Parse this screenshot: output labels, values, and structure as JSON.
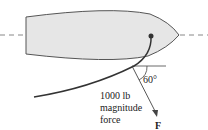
{
  "diagram": {
    "angle_label": "60°",
    "force_text": [
      "1000 lb",
      "magnitude",
      "force"
    ],
    "vector_label": "F",
    "colors": {
      "hull_fill": "#e6e6e6",
      "line": "#444444",
      "dash": "#888888"
    }
  }
}
